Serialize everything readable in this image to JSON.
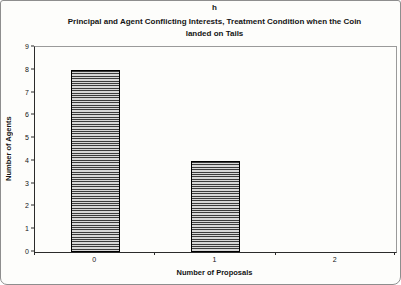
{
  "figure": {
    "header": "h"
  },
  "chart_data": {
    "type": "bar",
    "title": "Principal and Agent Conflicting Interests, Treatment Condition when the Coin landed on Tails",
    "title_lines": [
      "Principal and Agent Conflicting Interests, Treatment Condition when the Coin",
      "landed on Tails"
    ],
    "xlabel": "Number of Proposals",
    "ylabel": "Number of Agents",
    "categories": [
      "0",
      "1",
      "2"
    ],
    "values": [
      8,
      4,
      0
    ],
    "ylim": [
      0,
      9
    ],
    "yticks": [
      0,
      1,
      2,
      3,
      4,
      5,
      6,
      7,
      8,
      9
    ],
    "grid": false,
    "legend_position": "none",
    "bar_fill": "#d7d7d7",
    "bar_hatch": "horizontal-lines",
    "bar_hatch_color": "#3c3c3c",
    "bar_border_color": "#000000",
    "frame_color": "#9a9a9a",
    "axis_color": "#2b2b2b"
  }
}
